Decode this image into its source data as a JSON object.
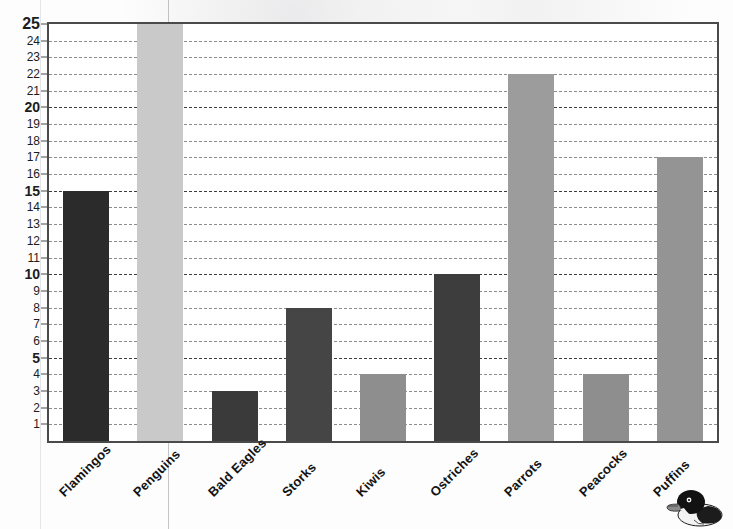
{
  "chart_data": {
    "type": "bar",
    "title": "",
    "xlabel": "",
    "ylabel": "",
    "ylim": [
      0,
      25
    ],
    "grid": true,
    "legend": "none",
    "categories": [
      "Flamingos",
      "Penguins",
      "Bald Eagles",
      "Storks",
      "Kiwis",
      "Ostriches",
      "Parrots",
      "Peacocks",
      "Puffins"
    ],
    "values": [
      15,
      25,
      3,
      8,
      4,
      10,
      22,
      4,
      17
    ],
    "bar_colors": [
      "#2b2b2b",
      "#c9c9c9",
      "#3a3a3a",
      "#454545",
      "#8e8e8e",
      "#3d3d3d",
      "#9c9c9c",
      "#8e8e8e",
      "#949494"
    ],
    "ytick_labels": [
      "1",
      "2",
      "3",
      "4",
      "5",
      "6",
      "7",
      "8",
      "9",
      "10",
      "11",
      "12",
      "13",
      "14",
      "15",
      "16",
      "17",
      "18",
      "19",
      "20",
      "21",
      "22",
      "23",
      "24",
      "25"
    ],
    "ytick_major": [
      5,
      10,
      15,
      20,
      25
    ],
    "ytick_step": 1
  },
  "decor": {
    "illustration": "puffin-bird",
    "frame_color": "#4a4a4a",
    "gridline_color": "#8c8c8c",
    "gridline_major_color": "#3d3d3d",
    "background": "#ffffff"
  }
}
